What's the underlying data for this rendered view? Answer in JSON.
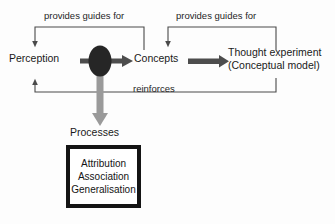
{
  "diagram": {
    "nodes": {
      "perception": "Perception",
      "concepts": "Concepts",
      "thought_experiment_line1": "Thought experiment",
      "thought_experiment_line2": "(Conceptual model)",
      "processes": "Processes"
    },
    "edge_labels": {
      "guides_left": "provides guides for",
      "guides_right": "provides guides for",
      "reinforces": "reinforces"
    },
    "processes_box": {
      "items": [
        "Attribution",
        "Association",
        "Generalisation"
      ]
    },
    "colors": {
      "ink": "#1a1a1a",
      "thin_line": "#4a4a4a",
      "thick_arrow": "#4d4d4d",
      "gray_arrow": "#9a9a9a",
      "ellipse": "#262626",
      "box_border": "#141414",
      "background": "#fdfdfd"
    }
  }
}
